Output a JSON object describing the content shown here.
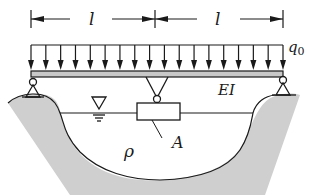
{
  "diagram": {
    "span_labels": [
      "l",
      "l"
    ],
    "load_label": "q0",
    "load_label_main": "q",
    "load_label_sub": "0",
    "stiffness_label": "EI",
    "float_label": "A",
    "density_label": "ρ",
    "colors": {
      "ground": "#cfcfcf",
      "line": "#1a1a1a",
      "beam": "#c8c8c8"
    },
    "load_arrow_count": 18
  }
}
